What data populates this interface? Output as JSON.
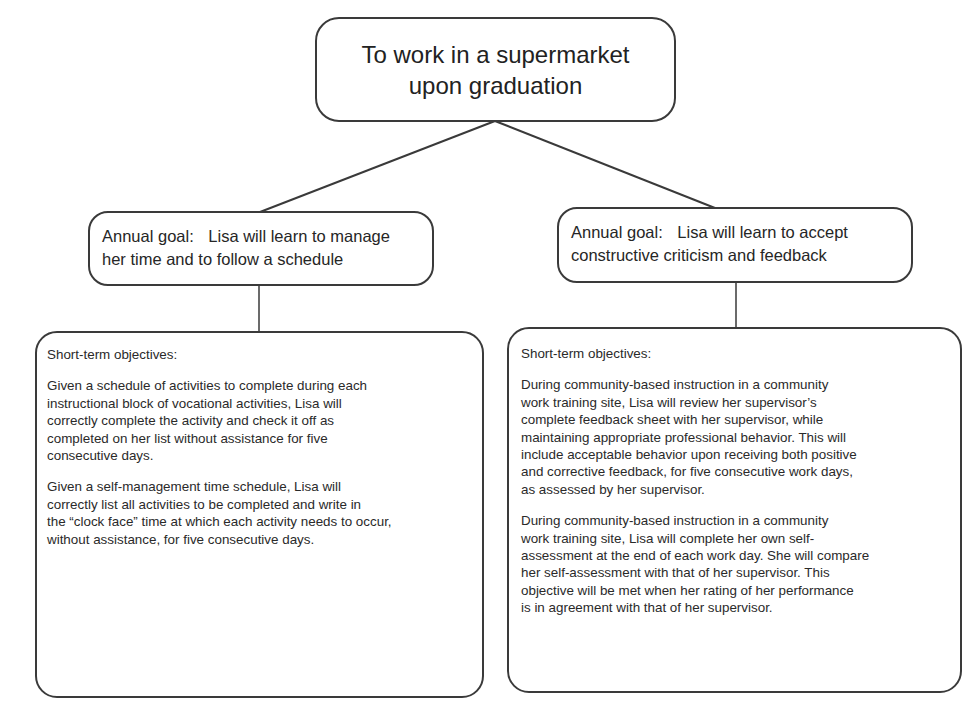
{
  "diagram": {
    "top_goal": {
      "line1": "To work in a supermarket",
      "line2": "upon graduation"
    },
    "branches": [
      {
        "annual_goal": {
          "label": "Annual goal:",
          "text_line1": "Lisa will learn to manage",
          "text_line2": "her time and to follow a schedule"
        },
        "objectives": {
          "heading": "Short-term objectives:",
          "items": [
            "Given a schedule of activities to complete during each\ninstructional block of vocational activities, Lisa will\ncorrectly complete the activity and check it off as\ncompleted on her list without assistance for five\nconsecutive days.",
            "Given a self-management time schedule, Lisa will\ncorrectly list all activities to be completed and write in\nthe “clock face” time at which each activity needs to occur,\nwithout assistance, for five consecutive days."
          ]
        }
      },
      {
        "annual_goal": {
          "label": "Annual goal:",
          "text_line1": "Lisa will learn to accept",
          "text_line2": "constructive criticism and feedback"
        },
        "objectives": {
          "heading": "Short-term objectives:",
          "items": [
            "During community-based instruction in a community\nwork training site, Lisa will review her supervisor’s\ncomplete feedback sheet with her supervisor, while\nmaintaining appropriate professional behavior. This will\ninclude acceptable behavior upon receiving both positive\nand corrective feedback, for five consecutive work days,\nas assessed by her supervisor.",
            "During community-based instruction in a community\nwork training site, Lisa will complete her own self-\nassessment at the end of each work day. She will compare\nher self-assessment with that of her supervisor. This\nobjective will be met when her rating of her performance\nis in agreement with that of her supervisor."
          ]
        }
      }
    ]
  },
  "colors": {
    "stroke": "#3a3a3a",
    "text": "#2a2a2a",
    "background": "#ffffff"
  }
}
